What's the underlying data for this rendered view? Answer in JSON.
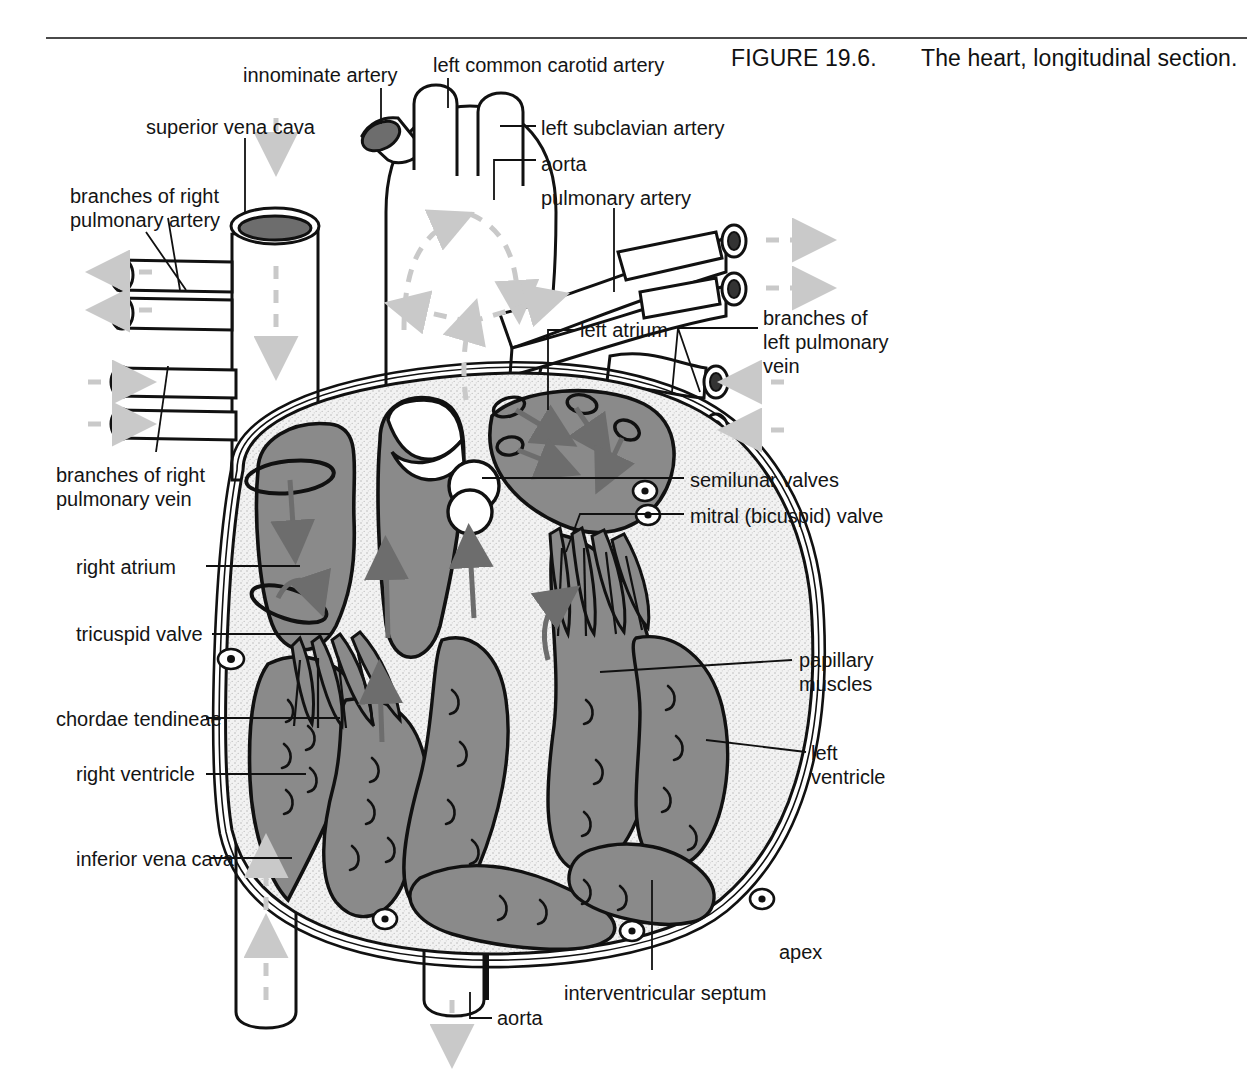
{
  "figure": {
    "rule_color": "#4a4a4a",
    "number_label": "FIGURE 19.6.",
    "caption": "The heart, longitudinal section."
  },
  "colors": {
    "blood_gray": "#8a8a8a",
    "myocardium_stipple": "#ededed",
    "outline": "#111111",
    "flow_arrow": "#c9c9c9",
    "chamber_arrow": "#6d6d6d",
    "lumen_dark": "#555555",
    "page_background": "#ffffff"
  },
  "labels": [
    {
      "id": "innominate-artery",
      "text": "innominate artery",
      "x": 243,
      "y": 63,
      "align": "left"
    },
    {
      "id": "left-common-carotid-artery",
      "text": "left common carotid artery",
      "x": 433,
      "y": 53,
      "align": "left"
    },
    {
      "id": "superior-vena-cava",
      "text": "superior vena cava",
      "x": 146,
      "y": 115,
      "align": "left"
    },
    {
      "id": "left-subclavian-artery",
      "text": "left subclavian artery",
      "x": 541,
      "y": 116,
      "align": "left"
    },
    {
      "id": "aorta-arch",
      "text": "aorta",
      "x": 541,
      "y": 152,
      "align": "left"
    },
    {
      "id": "branches-of-right-pulmonary-artery",
      "text": "branches of right\npulmonary artery",
      "x": 70,
      "y": 184,
      "align": "left"
    },
    {
      "id": "pulmonary-artery",
      "text": "pulmonary artery",
      "x": 541,
      "y": 186,
      "align": "left"
    },
    {
      "id": "left-atrium",
      "text": "left atrium",
      "x": 580,
      "y": 318,
      "align": "left"
    },
    {
      "id": "branches-of-left-pulmonary-vein",
      "text": "branches of\nleft pulmonary\nvein",
      "x": 763,
      "y": 306,
      "align": "left"
    },
    {
      "id": "branches-of-right-pulmonary-vein",
      "text": "branches of right\npulmonary vein",
      "x": 56,
      "y": 463,
      "align": "left"
    },
    {
      "id": "semilunar-valves",
      "text": "semilunar valves",
      "x": 690,
      "y": 468,
      "align": "left"
    },
    {
      "id": "mitral-bicuspid-valve",
      "text": "mitral (bicuspid) valve",
      "x": 690,
      "y": 504,
      "align": "left"
    },
    {
      "id": "right-atrium",
      "text": "right atrium",
      "x": 76,
      "y": 555,
      "align": "left"
    },
    {
      "id": "tricuspid-valve",
      "text": "tricuspid valve",
      "x": 76,
      "y": 622,
      "align": "left"
    },
    {
      "id": "papillary-muscles",
      "text": "papillary\nmuscles",
      "x": 799,
      "y": 648,
      "align": "left"
    },
    {
      "id": "chordae-tendineae",
      "text": "chordae tendineae",
      "x": 56,
      "y": 707,
      "align": "left"
    },
    {
      "id": "left-ventricle",
      "text": "left\nventricle",
      "x": 811,
      "y": 741,
      "align": "left"
    },
    {
      "id": "right-ventricle",
      "text": "right ventricle",
      "x": 76,
      "y": 762,
      "align": "left"
    },
    {
      "id": "inferior-vena-cava",
      "text": "inferior vena cava",
      "x": 76,
      "y": 847,
      "align": "left"
    },
    {
      "id": "apex",
      "text": "apex",
      "x": 779,
      "y": 940,
      "align": "left"
    },
    {
      "id": "interventricular-septum",
      "text": "interventricular septum",
      "x": 564,
      "y": 981,
      "align": "left"
    },
    {
      "id": "aorta-descending",
      "text": "aorta",
      "x": 497,
      "y": 1006,
      "align": "left"
    }
  ]
}
